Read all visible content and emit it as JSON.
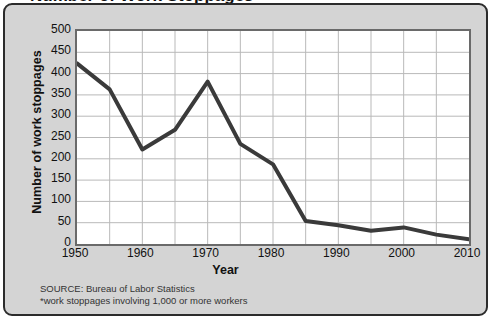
{
  "title": "Number of Work Stoppages*",
  "chart_data": {
    "type": "line",
    "title": "Number of Work Stoppages*",
    "xlabel": "Year",
    "ylabel": "Number of work stoppages",
    "xlim": [
      1950,
      2010
    ],
    "ylim": [
      0,
      500
    ],
    "grid": true,
    "legend": "none",
    "x_ticks": [
      1950,
      1960,
      1970,
      1980,
      1990,
      2000,
      2010
    ],
    "y_ticks": [
      0,
      50,
      100,
      150,
      200,
      250,
      300,
      350,
      400,
      450,
      500
    ],
    "x": [
      1950,
      1955,
      1960,
      1965,
      1970,
      1975,
      1980,
      1985,
      1990,
      1995,
      2000,
      2005,
      2010
    ],
    "values": [
      424,
      363,
      222,
      268,
      381,
      235,
      187,
      54,
      44,
      31,
      39,
      22,
      11
    ],
    "line_color": "#3a3a3a",
    "line_width": 4
  },
  "notes": {
    "source": "SOURCE: Bureau of Labor Statistics",
    "footnote": "*work stoppages involving 1,000 or more workers"
  },
  "colors": {
    "panel_background": "#d4d4d4",
    "panel_border": "#2b2b2b",
    "plot_background": "#ffffff",
    "plot_border": "#6a6a6a",
    "grid": "#b9b9b9",
    "line": "#3a3a3a",
    "text": "#111111"
  }
}
